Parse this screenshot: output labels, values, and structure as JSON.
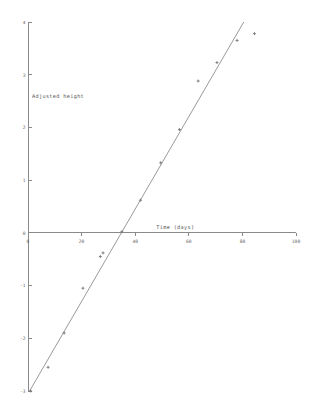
{
  "chart_data": {
    "type": "scatter",
    "title": "",
    "xlabel": "Time (days)",
    "ylabel": "Adjusted height",
    "xlim": [
      0,
      100
    ],
    "ylim": [
      -3,
      4
    ],
    "grid": false,
    "legend": null,
    "xticks": [
      0,
      20,
      40,
      60,
      80,
      100
    ],
    "xtick_labels": [
      "0",
      "20",
      "40",
      "60",
      "80",
      "100"
    ],
    "yticks": [
      -3,
      -2,
      -1,
      0,
      1,
      2,
      3,
      4
    ],
    "ytick_labels": [
      "-3",
      "-2",
      "-1",
      "0",
      "1",
      "2",
      "3",
      "4"
    ],
    "x_axis_position": 0,
    "y_axis_position": 0,
    "points": [
      {
        "x": 1.0,
        "y": -3.0
      },
      {
        "x": 7.5,
        "y": -2.55
      },
      {
        "x": 13.5,
        "y": -1.9
      },
      {
        "x": 20.5,
        "y": -1.05
      },
      {
        "x": 27.0,
        "y": -0.45
      },
      {
        "x": 28.0,
        "y": -0.38
      },
      {
        "x": 35.0,
        "y": 0.02
      },
      {
        "x": 42.0,
        "y": 0.62
      },
      {
        "x": 49.5,
        "y": 1.33
      },
      {
        "x": 56.5,
        "y": 1.96
      },
      {
        "x": 63.5,
        "y": 2.88
      },
      {
        "x": 70.5,
        "y": 3.23
      },
      {
        "x": 78.0,
        "y": 3.65
      },
      {
        "x": 84.5,
        "y": 3.78
      }
    ],
    "fit_line": {
      "label": "",
      "x_start": 0.6,
      "y_start": -3.0,
      "x_end": 80.5,
      "y_end": 4.0,
      "slope": 0.0877,
      "intercept": -3.05
    }
  },
  "axis_titles": {
    "x": "Time (days)",
    "y": "Adjusted height"
  }
}
